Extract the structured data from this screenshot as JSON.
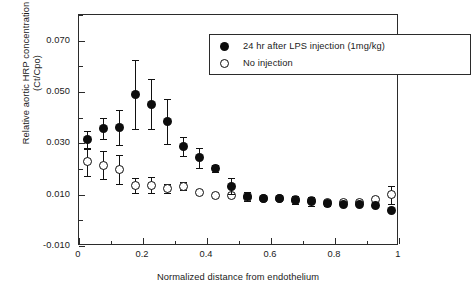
{
  "chart_data": {
    "type": "scatter",
    "title": "",
    "xlabel": "Normalized distance from endothelium",
    "ylabel": "Relative aortic HRP concentration\n(Ct/Cpo)",
    "xlim": [
      0,
      1
    ],
    "ylim": [
      -0.01,
      0.08
    ],
    "grid": false,
    "legend_position": "top-center",
    "xticks": [
      "0",
      "0.2",
      "0.4",
      "0.6",
      "0.8",
      "1"
    ],
    "xtick_values": [
      0,
      0.2,
      0.4,
      0.6,
      0.8,
      1
    ],
    "xtick_minor_values": [
      0.1,
      0.3,
      0.5,
      0.7,
      0.9
    ],
    "yticks": [
      "0.070",
      "0.050",
      "0.030",
      "0.010",
      "-0.010"
    ],
    "ytick_values": [
      0.07,
      0.05,
      0.03,
      0.01,
      -0.01
    ],
    "ytick_minor_values": [
      0.08,
      0.06,
      0.04,
      0.02,
      0.0
    ],
    "x": [
      0.025,
      0.075,
      0.125,
      0.175,
      0.225,
      0.275,
      0.325,
      0.375,
      0.425,
      0.475,
      0.525,
      0.575,
      0.625,
      0.675,
      0.725,
      0.775,
      0.825,
      0.875,
      0.925,
      0.975
    ],
    "series": [
      {
        "name": "24 hr after LPS injection (1mg/kg)",
        "marker": "filled-circle",
        "color": "#0d0d0d",
        "values": [
          0.0313,
          0.0358,
          0.0362,
          0.049,
          0.0452,
          0.0385,
          0.0288,
          0.0243,
          0.0203,
          0.0133,
          0.0093,
          0.0087,
          0.0086,
          0.0079,
          0.0073,
          0.0066,
          0.0062,
          0.0062,
          0.0057,
          0.004
        ],
        "errors": [
          0.0035,
          0.0042,
          0.0068,
          0.0135,
          0.0098,
          0.0088,
          0.0038,
          0.004,
          0.0013,
          0.003,
          0.0018,
          0.0005,
          0.0005,
          0.0015,
          0.0017,
          0.0012,
          0.0008,
          0.0005,
          0.0005,
          0.0005
        ]
      },
      {
        "name": "No injection",
        "marker": "open-circle",
        "color": "#ffffff",
        "values": [
          0.0228,
          0.0215,
          0.0198,
          0.0135,
          0.0137,
          0.0124,
          0.0133,
          0.0107,
          0.0098,
          0.0096,
          0.0088,
          0.0086,
          0.0086,
          0.008,
          0.0078,
          0.007,
          0.0071,
          0.0071,
          0.0083,
          0.0099
        ],
        "errors": [
          0.0055,
          0.0055,
          0.0055,
          0.003,
          0.003,
          0.0018,
          0.0015,
          0.0005,
          0.0005,
          0.0005,
          0.0005,
          0.0005,
          0.0005,
          0.0005,
          0.0005,
          0.0005,
          0.0005,
          0.0005,
          0.0005,
          0.0035
        ]
      }
    ]
  },
  "legend": {
    "items": [
      {
        "label": "24 hr after LPS injection (1mg/kg)",
        "marker": "filled-circle"
      },
      {
        "label": "No injection",
        "marker": "open-circle"
      }
    ]
  },
  "axes": {
    "x_title": "Normalized distance from endothelium",
    "y_title": "Relative aortic HRP concentration\n(Ct/Cpo)"
  }
}
